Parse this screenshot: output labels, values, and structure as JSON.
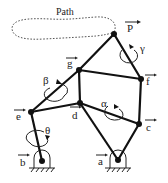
{
  "diagram": {
    "path_label": "Path",
    "points": [
      {
        "id": "P",
        "label": "P",
        "has_arrow": true
      },
      {
        "id": "g",
        "label": "g",
        "has_arrow": true
      },
      {
        "id": "f",
        "label": "f",
        "has_arrow": true
      },
      {
        "id": "d",
        "label": "d",
        "has_arrow": true
      },
      {
        "id": "e",
        "label": "e",
        "has_arrow": true
      },
      {
        "id": "c",
        "label": "c",
        "has_arrow": true
      },
      {
        "id": "b",
        "label": "b",
        "has_arrow": true,
        "ground": true
      },
      {
        "id": "a",
        "label": "a",
        "has_arrow": true,
        "ground": true
      }
    ],
    "links": [
      [
        "b",
        "e"
      ],
      [
        "e",
        "g"
      ],
      [
        "g",
        "P"
      ],
      [
        "P",
        "f"
      ],
      [
        "g",
        "f"
      ],
      [
        "g",
        "d"
      ],
      [
        "e",
        "d"
      ],
      [
        "d",
        "c"
      ],
      [
        "f",
        "c"
      ],
      [
        "d",
        "a"
      ],
      [
        "c",
        "a"
      ]
    ],
    "angles": [
      {
        "symbol": "θ",
        "near": "b-e"
      },
      {
        "symbol": "β",
        "near": "e-g"
      },
      {
        "symbol": "α",
        "near": "d-c"
      },
      {
        "symbol": "γ",
        "near": "P-f"
      }
    ]
  }
}
